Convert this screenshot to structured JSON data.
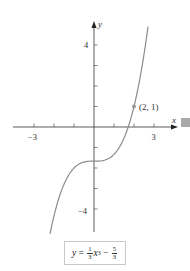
{
  "chart_data": {
    "type": "line",
    "title": "",
    "function": "y = (1/3)x^3 - 5/3",
    "xlabel": "x",
    "ylabel": "y",
    "xlim": [
      -4,
      4.2
    ],
    "ylim": [
      -5.2,
      5
    ],
    "x_ticks": [
      -3,
      -2,
      -1,
      1,
      2,
      3
    ],
    "x_tick_labels": {
      "-3": "−3",
      "3": "3"
    },
    "y_ticks": [
      -4,
      -3,
      -2,
      -1,
      1,
      2,
      3,
      4
    ],
    "y_tick_labels": {
      "4": "4",
      "-4": "−4"
    },
    "grid": false,
    "series": [
      {
        "name": "y = (1/3)x^3 - 5/3",
        "color": "#8c8c8c",
        "x": [
          -2.2,
          -2.0,
          -1.5,
          -1.0,
          -0.5,
          0,
          0.5,
          1.0,
          1.5,
          2.0,
          2.5,
          2.7
        ],
        "values": [
          -5.22,
          -4.33,
          -2.79,
          -2.0,
          -1.71,
          -1.67,
          -1.62,
          -1.33,
          -0.54,
          1.0,
          3.54,
          4.9
        ]
      }
    ],
    "annotations": [
      {
        "point": [
          2,
          1
        ],
        "label": "(2, 1)"
      }
    ]
  },
  "labels": {
    "x_axis": "x",
    "y_axis": "y",
    "tick_x_neg3": "−3",
    "tick_x_3": "3",
    "tick_y_4": "4",
    "tick_y_neg4": "−4",
    "point_label": "(2, 1)"
  },
  "equation": {
    "lhs": "y",
    "eq": " = ",
    "frac1_num": "1",
    "frac1_den": "3",
    "var": "x",
    "exp": "3",
    "minus": " − ",
    "frac2_num": "5",
    "frac2_den": "3"
  },
  "colors": {
    "axis": "#333333",
    "curve": "#8c8c8c",
    "point": "#9a9a9a",
    "marker_square": "#a9a9a9"
  }
}
